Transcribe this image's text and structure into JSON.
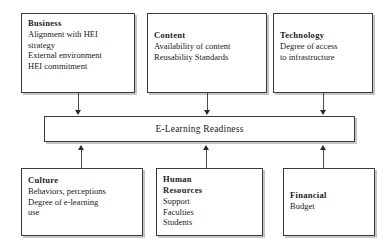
{
  "diagram": {
    "center": {
      "label": "E-Learning Readiness"
    },
    "top_boxes": [
      {
        "id": "business",
        "title": "Business",
        "lines": [
          "Alignment with HEI",
          "strategy",
          "External environment",
          "HEI commitment"
        ]
      },
      {
        "id": "content",
        "title": "Content",
        "lines": [
          "Availability of content",
          "Reusability Standards"
        ]
      },
      {
        "id": "technology",
        "title": "Technology",
        "lines": [
          "Degree of access",
          "to infrastructure"
        ]
      }
    ],
    "bottom_boxes": [
      {
        "id": "culture",
        "title": "Culture",
        "lines": [
          "Behaviors, perceptions",
          "Degree of e-learning",
          "use"
        ]
      },
      {
        "id": "human-resources",
        "title": "Human\nResources",
        "lines": [
          "Support",
          "Faculties",
          "Students"
        ]
      },
      {
        "id": "financial",
        "title": "Financial",
        "lines": [
          "Budget"
        ]
      }
    ],
    "colors": {
      "border": "#3a3a3a",
      "shadow": "#969696",
      "arrow": "#2a2a2a",
      "background": "#ffffff",
      "text": "#1a1a1a"
    }
  }
}
